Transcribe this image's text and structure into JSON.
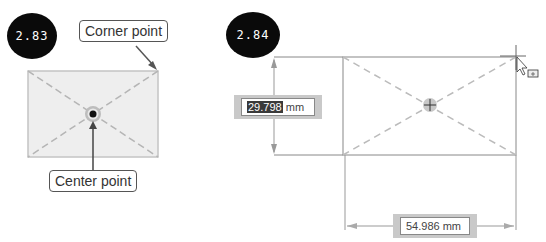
{
  "figures": [
    {
      "id": "2.83",
      "badge": "2.83",
      "callouts": {
        "corner": "Corner point",
        "center": "Center point"
      }
    },
    {
      "id": "2.84",
      "badge": "2.84",
      "dimensions": {
        "height": {
          "selected": "29.798",
          "unit": " mm"
        },
        "width": {
          "value": "54.986 mm"
        }
      },
      "cursor": "arrow-cursor-with-rectangle-icon"
    }
  ],
  "colors": {
    "badge_bg": "#0a0a0a",
    "rect_fill": "#ececec",
    "rect_stroke": "#bdbdbd",
    "dash": "#bbbbbb",
    "dim_box": "#c9c9c9"
  }
}
